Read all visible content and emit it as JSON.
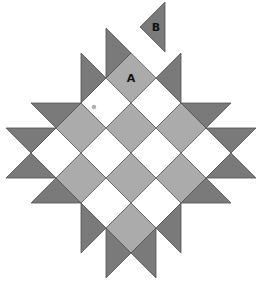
{
  "figure": {
    "labels": {
      "a": "A",
      "b": "B"
    },
    "colors": {
      "cell_gray": "#ababab",
      "cell_white": "#ffffff",
      "triangle": "#7a7a7a",
      "outline": "#5a5a5a",
      "dot": "#b0b0b0"
    },
    "grid": {
      "rows": 4,
      "cols": 4,
      "top_vertex": [
        131,
        53
      ],
      "step": 25
    },
    "triangles": [
      [
        [
          131,
          53
        ],
        [
          106,
          78
        ],
        [
          106,
          28
        ]
      ],
      [
        [
          106,
          78
        ],
        [
          81,
          103
        ],
        [
          81,
          53
        ]
      ],
      [
        [
          81,
          103
        ],
        [
          56,
          128
        ],
        [
          31,
          103
        ]
      ],
      [
        [
          56,
          128
        ],
        [
          31,
          153
        ],
        [
          6,
          128
        ]
      ],
      [
        [
          156,
          78
        ],
        [
          181,
          103
        ],
        [
          181,
          53
        ]
      ],
      [
        [
          181,
          103
        ],
        [
          206,
          128
        ],
        [
          231,
          103
        ]
      ],
      [
        [
          206,
          128
        ],
        [
          231,
          153
        ],
        [
          256,
          128
        ]
      ],
      [
        [
          31,
          153
        ],
        [
          56,
          178
        ],
        [
          6,
          178
        ]
      ],
      [
        [
          56,
          178
        ],
        [
          81,
          203
        ],
        [
          31,
          203
        ]
      ],
      [
        [
          81,
          203
        ],
        [
          106,
          228
        ],
        [
          81,
          253
        ]
      ],
      [
        [
          106,
          228
        ],
        [
          131,
          253
        ],
        [
          106,
          278
        ]
      ],
      [
        [
          231,
          153
        ],
        [
          206,
          178
        ],
        [
          256,
          178
        ]
      ],
      [
        [
          206,
          178
        ],
        [
          181,
          203
        ],
        [
          231,
          203
        ]
      ],
      [
        [
          181,
          203
        ],
        [
          156,
          228
        ],
        [
          181,
          253
        ]
      ],
      [
        [
          156,
          228
        ],
        [
          131,
          253
        ],
        [
          156,
          278
        ]
      ]
    ],
    "detached_triangle": [
      [
        165,
        2
      ],
      [
        165,
        52
      ],
      [
        140,
        27
      ]
    ],
    "label_positions": {
      "a": [
        131,
        82
      ],
      "b": [
        156,
        31
      ]
    },
    "dot": [
      94,
      107
    ]
  }
}
